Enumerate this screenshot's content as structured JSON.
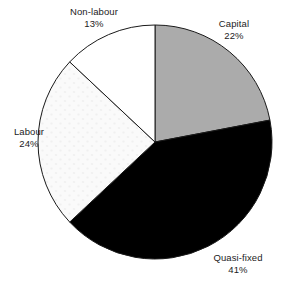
{
  "chart_data": {
    "type": "pie",
    "title": "",
    "subtitle": "",
    "xlabel": "",
    "ylabel": "",
    "legend_position": "none",
    "grid": false,
    "units": "percent",
    "start_angle_deg": 0,
    "direction": "clockwise",
    "categories": [
      "Capital",
      "Quasi-fixed",
      "Labour",
      "Non-labour"
    ],
    "values": [
      22,
      41,
      24,
      13
    ],
    "slices": [
      {
        "label": "Capital",
        "value": 22,
        "value_text": "22%",
        "fill": "#ababab",
        "stroke": "#1a1a1a",
        "pattern": "solid",
        "start_deg": 0,
        "end_deg": 79.2
      },
      {
        "label": "Quasi-fixed",
        "value": 41,
        "value_text": "41%",
        "fill": "#000000",
        "stroke": "#1a1a1a",
        "pattern": "solid",
        "start_deg": 79.2,
        "end_deg": 226.8
      },
      {
        "label": "Labour",
        "value": 24,
        "value_text": "24%",
        "fill": "#f8f8f8",
        "stroke": "#1a1a1a",
        "pattern": "faint-dots",
        "start_deg": 226.8,
        "end_deg": 313.2
      },
      {
        "label": "Non-labour",
        "value": 13,
        "value_text": "13%",
        "fill": "#ffffff",
        "stroke": "#1a1a1a",
        "pattern": "solid",
        "start_deg": 313.2,
        "end_deg": 360
      }
    ]
  },
  "labels": {
    "capital": {
      "name": "Capital",
      "value": "22%"
    },
    "quasi_fixed": {
      "name": "Quasi-fixed",
      "value": "41%"
    },
    "labour": {
      "name": "Labour",
      "value": "24%"
    },
    "non_labour": {
      "name": "Non-labour",
      "value": "13%"
    }
  },
  "geometry": {
    "center_x": 155,
    "center_y": 142,
    "radius": 117
  }
}
